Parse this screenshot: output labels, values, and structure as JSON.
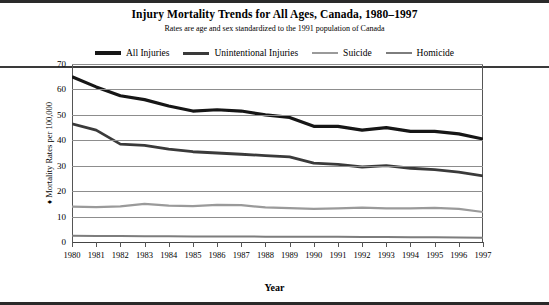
{
  "figure": {
    "title": "Injury Mortality Trends for All Ages, Canada, 1980–1997",
    "subtitle": "Rates are age and sex standardized to the 1991 population of Canada",
    "ylabel_bullet": "♦",
    "ylabel": "Mortality Rates per 100,000",
    "xlabel": "Year"
  },
  "legend": {
    "position": "top",
    "items": [
      {
        "label": "All Injuries",
        "color": "#161616",
        "width": 3.2
      },
      {
        "label": "Unintentional Injuries",
        "color": "#3a3a3a",
        "width": 3.0
      },
      {
        "label": "Suicide",
        "color": "#9a9a9a",
        "width": 2.6
      },
      {
        "label": "Homicide",
        "color": "#7d7d7d",
        "width": 2.4
      }
    ]
  },
  "chart_data": {
    "type": "line",
    "title": "Injury Mortality Trends for All Ages, Canada, 1980–1997",
    "subtitle": "Rates are age and sex standardized to the 1991 population of Canada",
    "xlabel": "Year",
    "ylabel": "Mortality Rates per 100,000",
    "x": [
      1980,
      1981,
      1982,
      1983,
      1984,
      1985,
      1986,
      1987,
      1988,
      1989,
      1990,
      1991,
      1992,
      1993,
      1994,
      1995,
      1996,
      1997
    ],
    "categories": [
      "1980",
      "1981",
      "1982",
      "1983",
      "1984",
      "1985",
      "1986",
      "1987",
      "1988",
      "1989",
      "1990",
      "1991",
      "1992",
      "1993",
      "1994",
      "1995",
      "1996",
      "1997"
    ],
    "ylim": [
      0,
      70
    ],
    "yticks": [
      0,
      10,
      20,
      30,
      40,
      50,
      60,
      70
    ],
    "grid": true,
    "legend_position": "top",
    "series": [
      {
        "name": "All Injuries",
        "color": "#161616",
        "values": [
          65.0,
          61.0,
          57.5,
          56.0,
          53.5,
          51.5,
          52.0,
          51.5,
          50.0,
          49.0,
          45.5,
          45.5,
          44.0,
          45.0,
          43.5,
          43.5,
          42.5,
          40.5
        ]
      },
      {
        "name": "Unintentional Injuries",
        "color": "#3a3a3a",
        "values": [
          46.5,
          44.0,
          38.5,
          38.0,
          36.5,
          35.5,
          35.0,
          34.5,
          34.0,
          33.5,
          31.0,
          30.5,
          29.5,
          30.0,
          29.0,
          28.5,
          27.5,
          26.0
        ]
      },
      {
        "name": "Suicide",
        "color": "#9a9a9a",
        "values": [
          13.9,
          13.7,
          14.0,
          15.0,
          14.3,
          14.1,
          14.6,
          14.5,
          13.6,
          13.3,
          13.0,
          13.2,
          13.5,
          13.2,
          13.2,
          13.4,
          13.0,
          11.8
        ]
      },
      {
        "name": "Homicide",
        "color": "#7d7d7d",
        "values": [
          2.5,
          2.4,
          2.4,
          2.3,
          2.3,
          2.2,
          2.2,
          2.2,
          2.1,
          2.1,
          2.1,
          2.1,
          2.0,
          2.0,
          1.9,
          1.9,
          1.8,
          1.7
        ]
      }
    ]
  }
}
